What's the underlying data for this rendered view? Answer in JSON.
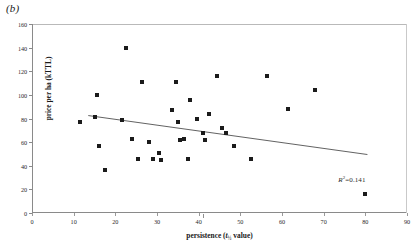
{
  "figure": {
    "panel_label": "(b)",
    "background_color": "#ffffff",
    "marker_color": "#1b1b1b",
    "axis_color": "#8a8a8a"
  },
  "chart_data": {
    "type": "scatter",
    "title": "",
    "panel": "(b)",
    "xlabel": "persistence (t½ value)",
    "xlabel_parts": {
      "text": "persistence (",
      "italic": "t",
      "sub": "½",
      "suffix": " value)"
    },
    "ylabel": "price per ha (kTTL)",
    "xlim": [
      0,
      90
    ],
    "ylim": [
      0,
      160
    ],
    "xticks": [
      0,
      10,
      20,
      30,
      40,
      50,
      60,
      70,
      80,
      90
    ],
    "yticks": [
      0,
      20,
      40,
      60,
      80,
      100,
      120,
      140,
      160
    ],
    "grid": false,
    "legend": null,
    "annotations": [
      {
        "text": "R²=0.141",
        "label": "R",
        "superscript": "2",
        "value": "=0.141",
        "x": 73.5,
        "y": 32
      }
    ],
    "trendline": {
      "type": "linear",
      "x_start": 13.5,
      "y_start": 82.5,
      "x_end": 80.5,
      "y_end": 49.5,
      "r_squared": 0.141
    },
    "points": [
      {
        "x": 11.5,
        "y": 77
      },
      {
        "x": 15.5,
        "y": 100
      },
      {
        "x": 15.0,
        "y": 81
      },
      {
        "x": 16.0,
        "y": 57
      },
      {
        "x": 17.5,
        "y": 36
      },
      {
        "x": 22.5,
        "y": 140
      },
      {
        "x": 21.5,
        "y": 79
      },
      {
        "x": 24.0,
        "y": 63
      },
      {
        "x": 25.5,
        "y": 46
      },
      {
        "x": 26.5,
        "y": 111
      },
      {
        "x": 28.0,
        "y": 60
      },
      {
        "x": 29.0,
        "y": 46
      },
      {
        "x": 30.5,
        "y": 51
      },
      {
        "x": 31.0,
        "y": 45
      },
      {
        "x": 33.5,
        "y": 87
      },
      {
        "x": 34.5,
        "y": 111
      },
      {
        "x": 35.0,
        "y": 77
      },
      {
        "x": 35.5,
        "y": 62
      },
      {
        "x": 36.5,
        "y": 63
      },
      {
        "x": 37.5,
        "y": 46
      },
      {
        "x": 38.0,
        "y": 96
      },
      {
        "x": 39.5,
        "y": 80
      },
      {
        "x": 41.0,
        "y": 68
      },
      {
        "x": 41.5,
        "y": 62
      },
      {
        "x": 42.5,
        "y": 84
      },
      {
        "x": 44.5,
        "y": 116
      },
      {
        "x": 45.5,
        "y": 72
      },
      {
        "x": 46.5,
        "y": 68
      },
      {
        "x": 48.5,
        "y": 57
      },
      {
        "x": 52.5,
        "y": 46
      },
      {
        "x": 56.5,
        "y": 116
      },
      {
        "x": 61.5,
        "y": 88
      },
      {
        "x": 68.0,
        "y": 104
      },
      {
        "x": 80.0,
        "y": 16
      }
    ]
  }
}
